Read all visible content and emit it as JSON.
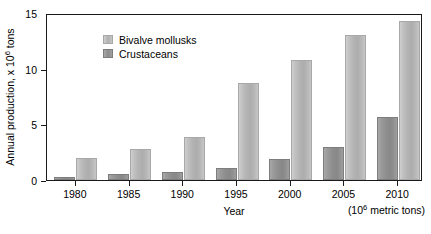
{
  "chart_data": {
    "type": "bar",
    "title": "",
    "xlabel": "Year",
    "ylabel": "Annual production, x 10⁶ tons",
    "ylabel_base": "Annual production, x 10",
    "ylabel_exp": "6",
    "ylabel_tail": " tons",
    "units_note_base": "(10",
    "units_note_exp": "6",
    "units_note_tail": " metric tons)",
    "categories": [
      "1980",
      "1985",
      "1990",
      "1995",
      "2000",
      "2005",
      "2010"
    ],
    "series": [
      {
        "name": "Crustaceans",
        "color": "#8d8d8d",
        "values": [
          0.3,
          0.5,
          0.7,
          1.1,
          1.9,
          3.0,
          5.7
        ]
      },
      {
        "name": "Bivalve mollusks",
        "color": "#b3b3b3",
        "values": [
          2.0,
          2.8,
          3.9,
          8.7,
          10.8,
          13.0,
          14.3
        ]
      }
    ],
    "legend_order": [
      "Bivalve mollusks",
      "Crustaceans"
    ],
    "legend_position": "top-left-inside",
    "ylim": [
      0,
      15
    ],
    "yticks": [
      0,
      5,
      10,
      15
    ],
    "ytick_labels": [
      "0",
      "5",
      "10",
      "15"
    ],
    "grid": false,
    "frame": true
  }
}
